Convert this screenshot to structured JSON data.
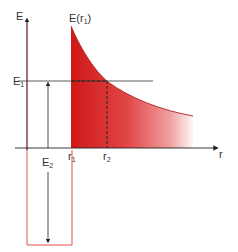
{
  "diagram": {
    "type": "potential-energy-diagram",
    "axes": {
      "y_label": "E",
      "x_label": "r"
    },
    "labels": {
      "curve_label": "E(r",
      "curve_label_sub": "1",
      "curve_label_close": ")",
      "e1_main": "E",
      "e1_sub": "1",
      "e2_main": "E",
      "e2_sub": "2",
      "r1_main": "r",
      "r1_sub": "1",
      "r2_main": "r",
      "r2_sub": "2"
    },
    "colors": {
      "fill_red": "#d42020",
      "well_outline": "#e05050",
      "axis": "#333333"
    }
  }
}
